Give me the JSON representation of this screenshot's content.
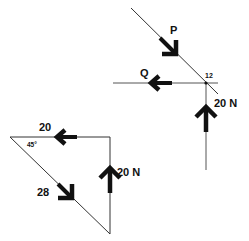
{
  "space_diagram": {
    "point_label": "12",
    "forces": [
      {
        "name": "P",
        "label": "P",
        "direction": "down-right along 45° line"
      },
      {
        "name": "Q",
        "label": "Q",
        "direction": "left"
      },
      {
        "name": "W",
        "label": "20 N",
        "direction": "up"
      }
    ]
  },
  "force_triangle": {
    "angle_label": "45°",
    "sides": [
      {
        "label": "20",
        "direction": "left",
        "position": "top"
      },
      {
        "label": "20 N",
        "direction": "up",
        "position": "right"
      },
      {
        "label": "28",
        "direction": "down-right",
        "position": "hypotenuse"
      }
    ]
  },
  "colors": {
    "ink": "#111111",
    "line": "#333333",
    "background": "#ffffff"
  }
}
